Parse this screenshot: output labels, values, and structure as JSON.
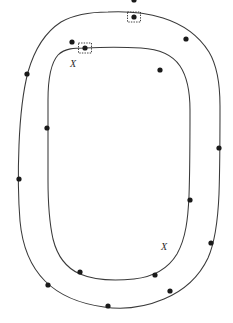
{
  "figure": {
    "canvas": {
      "width": 233,
      "height": 323,
      "background": "#ffffff"
    },
    "stroke_color": "#3a3a3a",
    "vertex_color": "#1a1a1a",
    "selection_color": "#2a2a2a"
  },
  "curves": [
    {
      "name": "outer-curve",
      "closed": true,
      "path": "M 108 12 C 128 11 147 13 163 18 C 182 24 199 36 209 52 C 218 67 220 86 220 106 C 220 135 220 165 219 194 C 218 218 216 240 208 258 C 199 277 183 291 164 299 C 145 307 124 310 104 307 C 82 304 60 296 45 281 C 29 265 22 243 20 221 C 18 196 18 170 19 145 C 20 120 22 95 28 72 C 34 51 44 33 61 22 C 75 14 92 12 108 12 Z",
      "vertices": [
        {
          "id": "o1",
          "x": 134,
          "y": 17,
          "selected": true
        },
        {
          "id": "o2",
          "x": 186,
          "y": 39,
          "selected": false
        },
        {
          "id": "o3",
          "x": 219,
          "y": 148,
          "selected": false
        },
        {
          "id": "o4",
          "x": 211,
          "y": 243,
          "selected": false
        },
        {
          "id": "o5",
          "x": 170,
          "y": 291,
          "selected": false
        },
        {
          "id": "o6",
          "x": 108,
          "y": 306,
          "selected": false
        },
        {
          "id": "o7",
          "x": 48,
          "y": 285,
          "selected": false
        },
        {
          "id": "o8",
          "x": 19,
          "y": 179,
          "selected": false
        },
        {
          "id": "o9",
          "x": 27,
          "y": 74,
          "selected": false
        },
        {
          "id": "o10",
          "x": 72,
          "y": 42,
          "selected": false
        }
      ]
    },
    {
      "name": "inner-curve",
      "closed": true,
      "path": "M 85 48 C 104 47 124 47 141 48 C 158 49 172 54 180 66 C 188 78 190 94 190 110 C 190 139 190 168 189 196 C 188 218 186 238 177 254 C 168 269 152 277 134 279 C 114 281 94 280 80 274 C 66 268 57 255 53 239 C 49 221 48 200 48 180 C 48 153 48 126 48 100 C 48 82 50 64 58 55 C 65 48 75 48 85 48 Z",
      "vertices": [
        {
          "id": "i1",
          "x": 85,
          "y": 48,
          "selected": true
        },
        {
          "id": "i2",
          "x": 160,
          "y": 70,
          "selected": false
        },
        {
          "id": "i3",
          "x": 190,
          "y": 200,
          "selected": false
        },
        {
          "id": "i4",
          "x": 155,
          "y": 275,
          "selected": false
        },
        {
          "id": "i5",
          "x": 80,
          "y": 272,
          "selected": false
        },
        {
          "id": "i6",
          "x": 47,
          "y": 128,
          "selected": false
        }
      ]
    }
  ],
  "selection_handles": [
    {
      "name": "selection-handle-outer",
      "x": 134,
      "y": 17,
      "width": 13,
      "height": 10
    },
    {
      "name": "selection-handle-inner",
      "x": 85,
      "y": 48,
      "width": 13,
      "height": 10
    }
  ],
  "labels": [
    {
      "name": "label-x-upper",
      "text": "X",
      "x": 72,
      "y": 64
    },
    {
      "name": "label-x-lower",
      "text": "X",
      "x": 163,
      "y": 247
    }
  ]
}
